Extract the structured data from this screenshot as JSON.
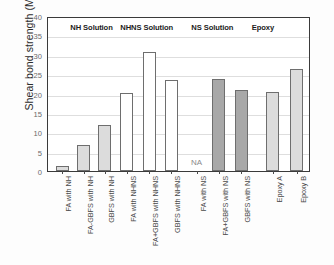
{
  "chart_data": {
    "type": "bar",
    "title": "",
    "subtitle": "",
    "xlabel": "",
    "ylabel": "Shear bond strength (MPa)",
    "ylim": [
      0,
      40
    ],
    "yticks": [
      0,
      5,
      10,
      15,
      20,
      25,
      30,
      35,
      40
    ],
    "ytick_labels": [
      "0",
      "5",
      "10",
      "15",
      "20",
      "25",
      "30",
      "35",
      "40"
    ],
    "grid": true,
    "legend_position": "none",
    "categories": [
      "FA with NH",
      "FA-GBFS with NH",
      "GBFS with NH",
      "FA with NHNS",
      "FA+GBFS with NHNS",
      "GBFS with NHNS",
      "FA with NS",
      "FA+GBFS with NS",
      "GBFS with NS",
      "Epoxy A",
      "Epoxy B"
    ],
    "values": [
      1.4,
      6.7,
      12.0,
      20.2,
      30.6,
      23.4,
      null,
      23.7,
      21.0,
      20.5,
      26.3
    ],
    "bar_fills": [
      "light-gray",
      "light-gray",
      "light-gray",
      "white",
      "white",
      "white",
      "none",
      "dark-gray",
      "dark-gray",
      "light-gray",
      "light-gray"
    ],
    "annotations": [
      {
        "text": "NA",
        "category": "FA with NS",
        "value": 1.2
      }
    ],
    "groups": [
      {
        "label": "NH Solution",
        "categories": [
          "FA with NH",
          "FA-GBFS with NH",
          "GBFS with NH"
        ]
      },
      {
        "label": "NHNS Solution",
        "categories": [
          "FA with NHNS",
          "FA+GBFS with NHNS",
          "GBFS with NHNS"
        ]
      },
      {
        "label": "NS Solution",
        "categories": [
          "FA with NS",
          "FA+GBFS with NS",
          "GBFS with NS"
        ]
      },
      {
        "label": "Epoxy",
        "categories": [
          "Epoxy A",
          "Epoxy B"
        ]
      }
    ],
    "colors": {
      "light_gray": "#dcdcdc",
      "white": "#ffffff",
      "dark_gray": "#a8a8a8",
      "bar_edge": "#6e6e6e",
      "axis": "#3a3a3a",
      "grid": "#dedede",
      "text": "#2c2c2c"
    }
  }
}
